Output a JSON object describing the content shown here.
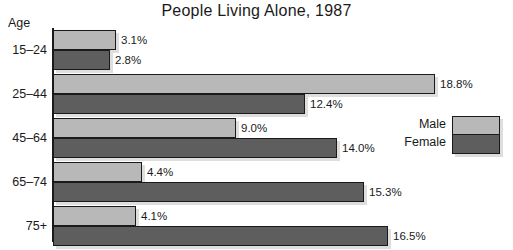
{
  "chart_data": {
    "type": "bar",
    "orientation": "horizontal",
    "title": "People Living Alone, 1987",
    "xlabel": "",
    "ylabel": "Age",
    "categories": [
      "15–24",
      "25–44",
      "45–64",
      "65–74",
      "75+"
    ],
    "series": [
      {
        "name": "Male",
        "color": "#b8b8b8",
        "values": [
          3.1,
          18.8,
          9.0,
          4.4,
          4.1
        ],
        "labels": [
          "3.1%",
          "18.8%",
          "9.0%",
          "4.4%",
          "4.1%"
        ]
      },
      {
        "name": "Female",
        "color": "#5e5e5e",
        "values": [
          2.8,
          12.4,
          14.0,
          15.3,
          16.5
        ],
        "labels": [
          "2.8%",
          "12.4%",
          "14.0%",
          "15.3%",
          "16.5%"
        ]
      }
    ],
    "xlim": [
      0,
      18.8
    ],
    "units": "percent",
    "grid": false,
    "legend_position": "right-middle",
    "legend_entries": [
      "Male",
      "Female"
    ]
  },
  "legend": {
    "male_label": "Male",
    "female_label": "Female"
  },
  "colors": {
    "male": "#b8b8b8",
    "female": "#5e5e5e",
    "outline": "#1a1a1a",
    "background": "#ffffff"
  }
}
